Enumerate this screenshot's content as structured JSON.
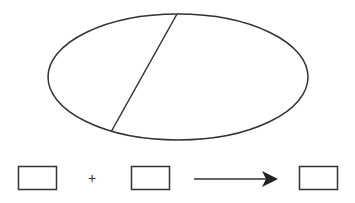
{
  "diagram": {
    "ellipse": {
      "cx": 178,
      "cy": 77,
      "rx": 130,
      "ry": 63,
      "stroke": "#333333"
    },
    "divider_line": {
      "x1": 177,
      "y1": 14,
      "x2": 111,
      "y2": 132
    },
    "equation": {
      "boxes": [
        {
          "x": 18,
          "y": 166,
          "w": 39,
          "h": 24
        },
        {
          "x": 131,
          "y": 166,
          "w": 39,
          "h": 24
        },
        {
          "x": 299,
          "y": 166,
          "w": 39,
          "h": 24
        }
      ],
      "plus_symbol": "+",
      "arrow": {
        "x1": 194,
        "x2": 277,
        "y": 179
      }
    },
    "stroke_color": "#333333"
  }
}
